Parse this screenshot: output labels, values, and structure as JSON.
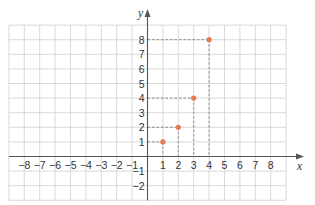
{
  "chart_data": {
    "type": "scatter",
    "title": "",
    "xlabel": "x",
    "ylabel": "y",
    "xlim": [
      -9,
      9
    ],
    "ylim": [
      -3,
      9
    ],
    "grid": true,
    "x_ticks": [
      -8,
      -7,
      -6,
      -5,
      -4,
      -3,
      -2,
      -1,
      1,
      2,
      3,
      4,
      5,
      6,
      7,
      8
    ],
    "y_ticks": [
      -2,
      -1,
      1,
      2,
      3,
      4,
      5,
      6,
      7,
      8
    ],
    "series": [
      {
        "name": "points",
        "color": "#e8784f",
        "points": [
          {
            "x": 1,
            "y": 1
          },
          {
            "x": 2,
            "y": 2
          },
          {
            "x": 3,
            "y": 4
          },
          {
            "x": 4,
            "y": 8
          }
        ],
        "dashed_projections": true
      }
    ]
  },
  "layout": {
    "origin_px": [
      147.5,
      156.5
    ],
    "x_unit_px": 15.4,
    "y_unit_px": 14.6,
    "colors": {
      "grid": "#cfcfcf",
      "axis": "#555555",
      "guide": "#7a7a7a",
      "point": "#e8784f",
      "text": "#333333"
    }
  },
  "labels": {
    "x_axis": "x",
    "y_axis": "y"
  }
}
